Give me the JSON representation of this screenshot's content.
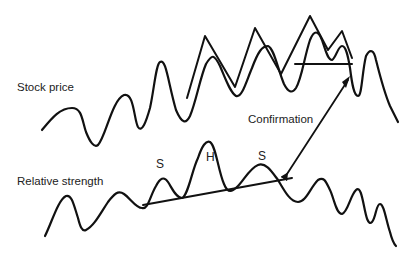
{
  "diagram": {
    "labels": {
      "stock_price": "Stock price",
      "relative_strength": "Relative strength",
      "confirmation": "Confirmation",
      "left_shoulder": "S",
      "head": "H",
      "right_shoulder": "S"
    },
    "elements": [
      {
        "id": "stock-price-line",
        "type": "wavy-line",
        "label": "Stock price"
      },
      {
        "id": "upper-channel-zigzag",
        "type": "zigzag-line"
      },
      {
        "id": "price-support-line",
        "type": "horizontal-line"
      },
      {
        "id": "relative-strength-line",
        "type": "wavy-line",
        "label": "Relative strength"
      },
      {
        "id": "neckline",
        "type": "rising-trendline"
      },
      {
        "id": "confirmation-arrow",
        "type": "double-headed-arrow",
        "label": "Confirmation"
      }
    ],
    "colors": {
      "stroke": "#111111",
      "text": "#222222",
      "background": "#ffffff"
    }
  }
}
